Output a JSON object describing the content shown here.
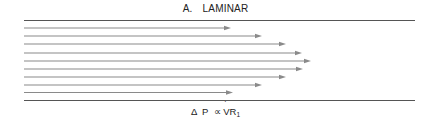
{
  "diagram": {
    "title_letter": "A.",
    "title": "LAMINAR",
    "formula": {
      "delta": "Δ",
      "p": "P",
      "proportional": "∝",
      "v": "V",
      "r": "R",
      "subscript": "1"
    },
    "colors": {
      "wall": "#555555",
      "arrow": "#8a8a8a",
      "text": "#222222"
    },
    "walls": {
      "x_start": 24,
      "x_end": 415,
      "top_y": 20.5,
      "bottom_y": 100.5
    },
    "arrows": [
      {
        "y": 28,
        "tip_x": 231
      },
      {
        "y": 36,
        "tip_x": 262
      },
      {
        "y": 44,
        "tip_x": 286
      },
      {
        "y": 53,
        "tip_x": 302
      },
      {
        "y": 61,
        "tip_x": 311
      },
      {
        "y": 69,
        "tip_x": 303
      },
      {
        "y": 77,
        "tip_x": 286
      },
      {
        "y": 85,
        "tip_x": 262
      },
      {
        "y": 92.5,
        "tip_x": 233
      }
    ]
  }
}
